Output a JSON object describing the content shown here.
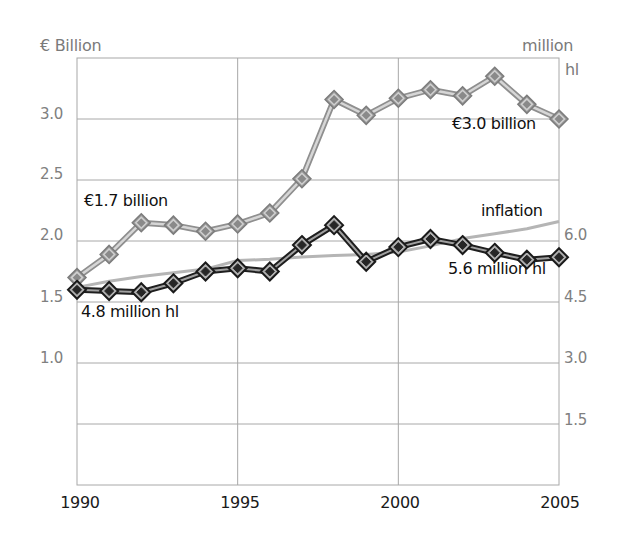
{
  "chart_data": {
    "type": "line",
    "title": "",
    "xlabel": "",
    "ylabel": "€ Billion",
    "ylabel_right": [
      "million",
      "hl"
    ],
    "xlim": [
      1990,
      2005
    ],
    "ylim": [
      0,
      3.5
    ],
    "ylim_right": [
      0,
      10.5
    ],
    "grid": true,
    "x_ticks": [
      "1990",
      "1995",
      "2000",
      "2005"
    ],
    "y_ticks_left": [
      "3.0",
      "2.5",
      "2.0",
      "1.5",
      "1.0"
    ],
    "y_ticks_right": [
      "6.0",
      "4.5",
      "3.0",
      "1.5"
    ],
    "x": [
      1990,
      1991,
      1992,
      1993,
      1994,
      1995,
      1996,
      1997,
      1998,
      1999,
      2000,
      2001,
      2002,
      2003,
      2004,
      2005
    ],
    "series": [
      {
        "name": "Value (€ billion)",
        "axis": "left",
        "color": "#b8b8b8",
        "values": [
          1.7,
          1.89,
          2.15,
          2.13,
          2.08,
          2.14,
          2.23,
          2.51,
          3.16,
          3.03,
          3.17,
          3.24,
          3.19,
          3.35,
          3.12,
          3.0
        ]
      },
      {
        "name": "Volume (million hl)",
        "axis": "right",
        "color": "#222222",
        "values": [
          4.8,
          4.77,
          4.74,
          4.96,
          5.25,
          5.33,
          5.25,
          5.9,
          6.39,
          5.49,
          5.85,
          6.05,
          5.9,
          5.71,
          5.54,
          5.6
        ]
      },
      {
        "name": "inflation",
        "axis": "left",
        "color": "#b5b5b5",
        "values": [
          1.62,
          1.67,
          1.71,
          1.74,
          1.77,
          1.84,
          1.85,
          1.87,
          1.88,
          1.89,
          1.91,
          1.96,
          2.02,
          2.06,
          2.1,
          2.16
        ]
      }
    ],
    "annotations": [
      {
        "text": "€1.7 billion",
        "target": "1990 value"
      },
      {
        "text": "€3.0 billion",
        "target": "2005 value"
      },
      {
        "text": "4.8 million hl",
        "target": "1990 volume"
      },
      {
        "text": "5.6 million hl",
        "target": "2005 volume"
      },
      {
        "text": "inflation",
        "target": "inflation line"
      }
    ],
    "legend": "none (inline annotations)"
  },
  "labels": {
    "left_axis_title": "€ Billion",
    "right_axis_title_line1": "million",
    "right_axis_title_line2": "hl",
    "annot_start_value": "€1.7 billion",
    "annot_end_value": "€3.0 billion",
    "annot_start_volume": "4.8 million hl",
    "annot_end_volume": "5.6 million hl",
    "annot_inflation": "inflation",
    "yl": [
      "3.0",
      "2.5",
      "2.0",
      "1.5",
      "1.0"
    ],
    "yr": [
      "6.0",
      "4.5",
      "3.0",
      "1.5"
    ],
    "xt": [
      "1990",
      "1995",
      "2000",
      "2005"
    ]
  }
}
